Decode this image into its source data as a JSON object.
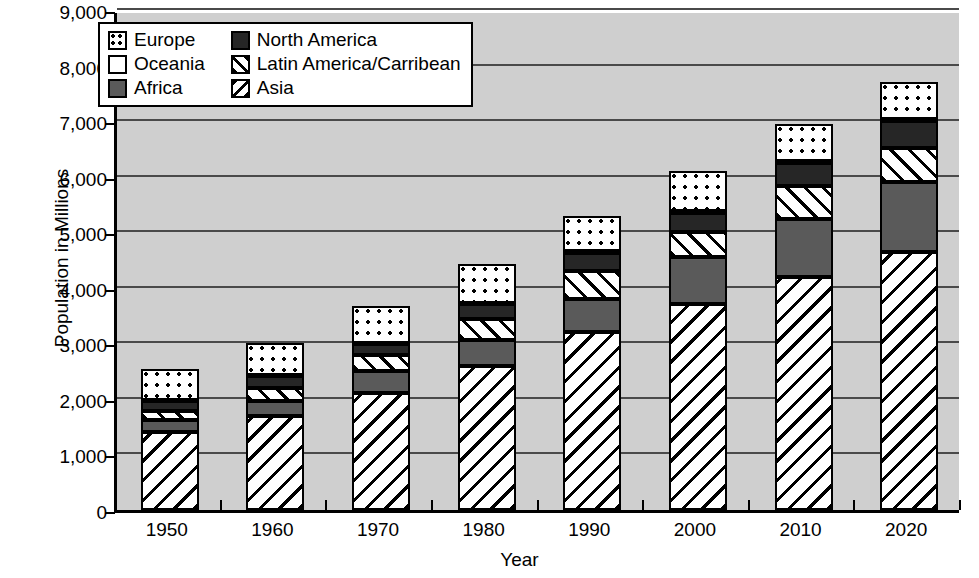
{
  "chart_data": {
    "type": "bar",
    "stacked": true,
    "title": "",
    "xlabel": "Year",
    "ylabel": "Population in Millions",
    "categories": [
      "1950",
      "1960",
      "1970",
      "1980",
      "1990",
      "2000",
      "2010",
      "2020"
    ],
    "ylim": [
      0,
      9000
    ],
    "ytick_labels": [
      "0",
      "1,000",
      "2,000",
      "3,000",
      "4,000",
      "5,000",
      "6,000",
      "7,000",
      "8,000",
      "9,000"
    ],
    "ytick_values": [
      0,
      1000,
      2000,
      3000,
      4000,
      5000,
      6000,
      7000,
      8000,
      9000
    ],
    "grid": true,
    "legend_position": "upper-left-inside",
    "stack_order_bottom_to_top": [
      "Asia",
      "Africa",
      "Latin America/Carribean",
      "North America",
      "Oceania",
      "Europe"
    ],
    "series": [
      {
        "name": "Asia",
        "pattern": "diagonal-backslash",
        "values": [
          1400,
          1700,
          2100,
          2600,
          3200,
          3700,
          4200,
          4650
        ]
      },
      {
        "name": "Africa",
        "pattern": "solid-gray",
        "values": [
          220,
          260,
          400,
          460,
          600,
          850,
          1030,
          1250
        ]
      },
      {
        "name": "Latin America/Carribean",
        "pattern": "diagonal-slash",
        "values": [
          160,
          240,
          290,
          380,
          500,
          450,
          600,
          620
        ]
      },
      {
        "name": "North America",
        "pattern": "solid-black",
        "values": [
          180,
          210,
          200,
          270,
          330,
          350,
          420,
          480
        ]
      },
      {
        "name": "Oceania",
        "pattern": "empty-white",
        "values": [
          13,
          16,
          20,
          23,
          27,
          30,
          36,
          42
        ]
      },
      {
        "name": "Europe",
        "pattern": "dotted",
        "values": [
          557,
          574,
          660,
          697,
          643,
          720,
          662,
          658
        ]
      }
    ],
    "totals": [
      2530,
      3000,
      3670,
      4430,
      5300,
      6100,
      6950,
      7700
    ]
  },
  "legend": {
    "entries_left": [
      {
        "label": "Europe",
        "swatch": "europe-swatch"
      },
      {
        "label": "Oceania",
        "swatch": "oceania-swatch"
      },
      {
        "label": "Africa",
        "swatch": "africa-swatch"
      }
    ],
    "entries_right": [
      {
        "label": "North America",
        "swatch": "north-america-swatch"
      },
      {
        "label": "Latin America/Carribean",
        "swatch": "latin-america-swatch"
      },
      {
        "label": "Asia",
        "swatch": "asia-swatch"
      }
    ]
  },
  "colors": {
    "plot_background": "#cfcfcf",
    "gridline": "#4a4a4a",
    "axis": "#000000",
    "africa": "#5a5a5a",
    "north_america": "#262626",
    "page_background": "#ffffff"
  }
}
